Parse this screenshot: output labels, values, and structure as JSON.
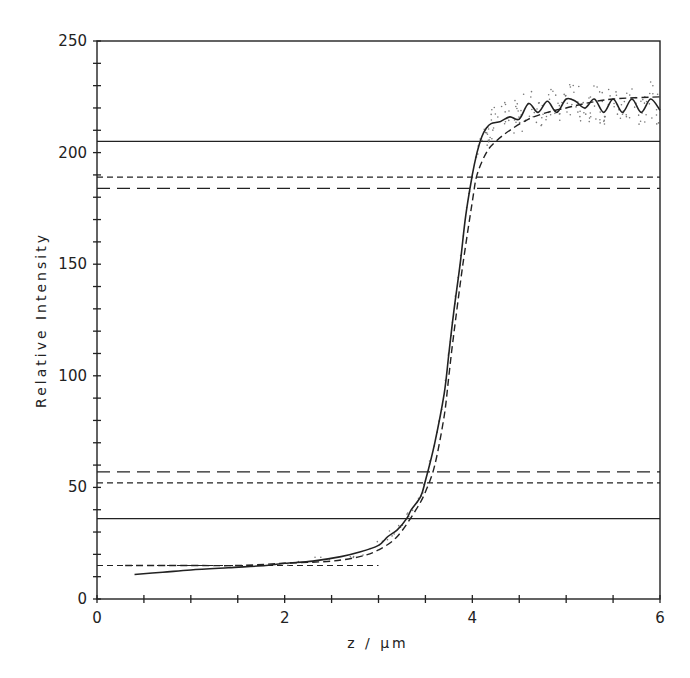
{
  "chart_data": {
    "type": "line",
    "title": "",
    "xlabel": "z / µm",
    "ylabel": "Relative Intensity",
    "xlim": [
      0,
      6
    ],
    "ylim": [
      0,
      250
    ],
    "x_ticks": [
      0,
      2,
      4,
      6
    ],
    "x_minor_step": 0.5,
    "y_ticks": [
      0,
      50,
      100,
      150,
      200,
      250
    ],
    "y_minor_step": 10,
    "grid": false,
    "legend": null,
    "series": [
      {
        "name": "measured profile",
        "style": "solid",
        "x": [
          0.4,
          0.7,
          1.0,
          1.4,
          1.8,
          2.0,
          2.3,
          2.6,
          2.8,
          3.0,
          3.1,
          3.2,
          3.3,
          3.35,
          3.45,
          3.5,
          3.6,
          3.7,
          3.75,
          3.8,
          3.87,
          3.93,
          4.0,
          4.05,
          4.1,
          4.15,
          4.2,
          4.3,
          4.4,
          4.5,
          4.6,
          4.7,
          4.8,
          4.9,
          5.0,
          5.1,
          5.2,
          5.3,
          5.4,
          5.5,
          5.6,
          5.7,
          5.8,
          5.9,
          6.0
        ],
        "y": [
          11,
          12,
          13,
          14,
          15,
          16,
          17,
          19,
          21,
          24,
          28,
          31,
          36,
          40,
          46,
          53,
          70,
          92,
          110,
          128,
          150,
          172,
          190,
          200,
          207,
          211,
          213,
          214,
          216,
          215,
          222,
          218,
          223,
          218,
          224,
          223,
          220,
          224,
          218,
          224,
          218,
          224,
          218,
          224,
          219
        ]
      },
      {
        "name": "fitted profile",
        "style": "dashed",
        "x": [
          0.3,
          1.0,
          1.5,
          2.0,
          2.5,
          2.8,
          3.0,
          3.2,
          3.4,
          3.5,
          3.6,
          3.7,
          3.75,
          3.8,
          3.9,
          4.0,
          4.05,
          4.15,
          4.25,
          4.4,
          4.6,
          4.8,
          5.0,
          5.2,
          5.5,
          6.0
        ],
        "y": [
          15,
          15,
          15,
          16,
          17,
          19,
          22,
          28,
          40,
          48,
          60,
          82,
          100,
          118,
          150,
          178,
          190,
          200,
          205,
          210,
          215,
          218,
          220,
          222,
          224,
          225
        ]
      }
    ],
    "reference_lines": [
      {
        "y": 205,
        "style": "solid"
      },
      {
        "y": 189,
        "style": "short-dash"
      },
      {
        "y": 184,
        "style": "long-dash"
      },
      {
        "y": 57,
        "style": "long-dash"
      },
      {
        "y": 52,
        "style": "short-dash"
      },
      {
        "y": 36,
        "style": "solid"
      },
      {
        "y": 15,
        "style": "short-dash",
        "x_end": 3.0
      }
    ],
    "scatter_note": "raw data points scattered around the measured profile (z 2.5–6)"
  },
  "plot": {
    "left": 97,
    "right": 660,
    "top": 41,
    "bottom": 599
  },
  "colors": {
    "ink": "#222222",
    "background": "#ffffff"
  }
}
